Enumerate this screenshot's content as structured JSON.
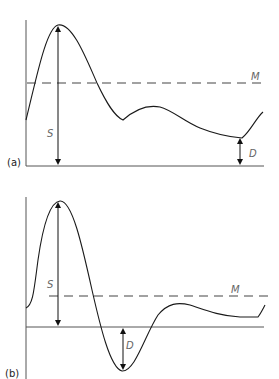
{
  "panels": [
    {
      "id": "a",
      "label": "(a)",
      "mean_label": "M",
      "systolic_label": "S",
      "diastolic_label": "D"
    },
    {
      "id": "b",
      "label": "(b)",
      "mean_label": "M",
      "systolic_label": "S",
      "diastolic_label": "D"
    }
  ],
  "colors": {
    "curve": "#1a1a1a",
    "axis": "#555555",
    "label": "#666666"
  }
}
